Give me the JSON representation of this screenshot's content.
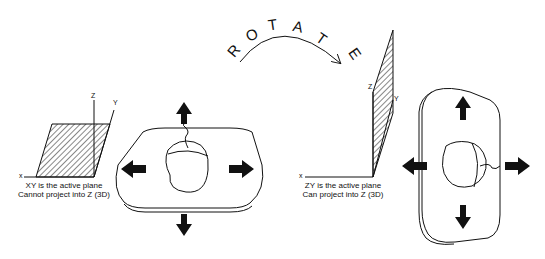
{
  "left_panel": {
    "axes": {
      "x": "x",
      "y": "Y",
      "z": "Z"
    },
    "caption_line1": "XY is the active plane",
    "caption_line2": "Cannot project into Z (3D)"
  },
  "rotate": {
    "letters": [
      "R",
      "O",
      "T",
      "A",
      "T",
      "E"
    ],
    "word": "ROTATE"
  },
  "right_panel": {
    "axes": {
      "x": "x",
      "y": "Y",
      "z": "Z"
    },
    "caption_line1": "ZY is the active plane",
    "caption_line2": "Can project into Z (3D)"
  },
  "colors": {
    "ink": "#111111",
    "background": "#ffffff"
  }
}
